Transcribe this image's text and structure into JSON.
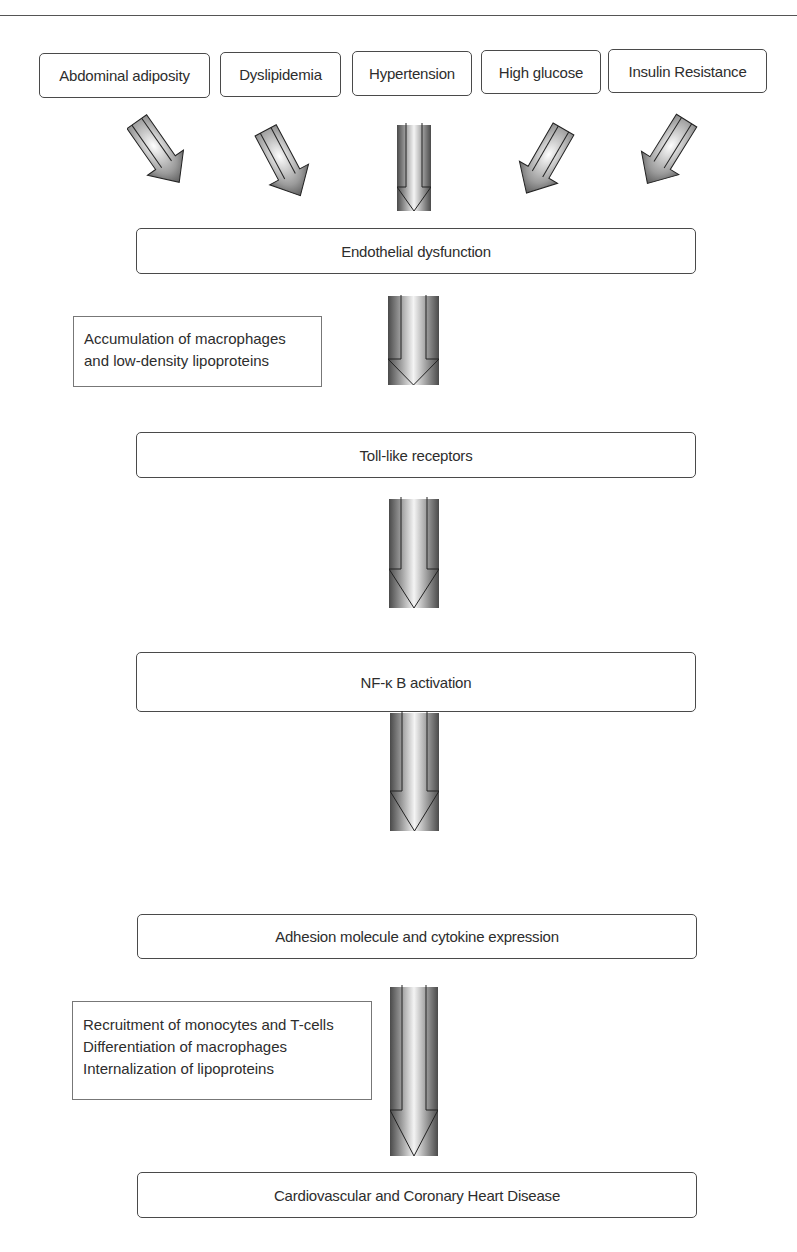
{
  "diagram": {
    "risk_factors": [
      {
        "label": "Abdominal adiposity"
      },
      {
        "label": "Dyslipidemia"
      },
      {
        "label": "Hypertension"
      },
      {
        "label": "High glucose"
      },
      {
        "label": "Insulin Resistance"
      }
    ],
    "steps": [
      {
        "label": "Endothelial dysfunction"
      },
      {
        "label": "Toll-like receptors"
      },
      {
        "label": "NF-κ B activation"
      },
      {
        "label": "Adhesion molecule and cytokine expression"
      },
      {
        "label": "Cardiovascular and Coronary Heart Disease"
      }
    ],
    "side_notes": [
      {
        "lines": [
          "Accumulation of macrophages",
          "and low-density lipoproteins"
        ]
      },
      {
        "lines": [
          "Recruitment of monocytes and T-cells",
          "Differentiation of macrophages",
          "Internalization of lipoproteins"
        ]
      }
    ],
    "arrow_icon": "block-down-arrow-icon",
    "colors": {
      "border": "#4a4a4a",
      "text": "#2d2d2d",
      "arrow_dark": "#3a3a3a",
      "arrow_light": "#ffffff"
    }
  }
}
